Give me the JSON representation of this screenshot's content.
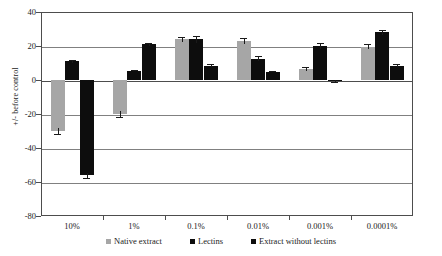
{
  "chart_data": {
    "type": "bar",
    "title": "",
    "xlabel": "",
    "ylabel": "+/- before control",
    "ylim": [
      -80,
      40
    ],
    "yticks": [
      40,
      20,
      0,
      -20,
      -40,
      -60,
      -80
    ],
    "grid": true,
    "legend_position": "bottom",
    "categories": [
      "10%",
      "1%",
      "0.1%",
      "0.01%",
      "0.001%",
      "0.0001%"
    ],
    "series": [
      {
        "name": "Native extract",
        "color": "#a6a6a6",
        "values": [
          -30,
          -20,
          24,
          23,
          6.5,
          19.5
        ],
        "errors": [
          2,
          1.5,
          1.5,
          2,
          1,
          1.5
        ]
      },
      {
        "name": "Lectins",
        "color": "#0d0d0d",
        "values": [
          11,
          5.5,
          24,
          12.5,
          20,
          28
        ],
        "errors": [
          1,
          0.5,
          2,
          1.5,
          2,
          1.5
        ]
      },
      {
        "name": "Extract without lectins",
        "color": "#0d0d0d",
        "values": [
          -56,
          21,
          8.5,
          5,
          -0.5,
          8.5
        ],
        "errors": [
          1.5,
          1,
          1,
          0.5,
          0.5,
          1
        ]
      }
    ]
  },
  "axis": {
    "y_title": "+/- before control",
    "y_tick_labels": [
      "40",
      "20",
      "0",
      "-20",
      "-40",
      "-60",
      "-80"
    ],
    "x_tick_labels": [
      "10%",
      "1%",
      "0.1%",
      "0.01%",
      "0.001%",
      "0.0001%"
    ]
  },
  "legend": {
    "items": [
      {
        "label": "Native extract",
        "color": "#a6a6a6"
      },
      {
        "label": "Lectins",
        "color": "#0d0d0d"
      },
      {
        "label": "Extract without lectins",
        "color": "#0d0d0d"
      }
    ]
  }
}
